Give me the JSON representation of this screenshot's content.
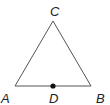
{
  "diagram": {
    "type": "triangle",
    "colors": {
      "line": "#555555",
      "point": "#111111",
      "label": "#222222"
    },
    "vertices": [
      {
        "name": "A",
        "x": 15,
        "y": 86
      },
      {
        "name": "B",
        "x": 91,
        "y": 86
      },
      {
        "name": "C",
        "x": 53,
        "y": 21
      }
    ],
    "points": [
      {
        "name": "D",
        "x": 53,
        "y": 86,
        "on_segment": "AB"
      }
    ],
    "labels": {
      "A": "A",
      "B": "B",
      "C": "C",
      "D": "D"
    }
  }
}
